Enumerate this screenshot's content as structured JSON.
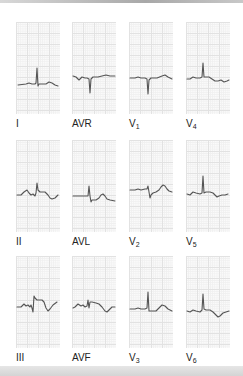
{
  "figure": {
    "trace_color": "#555555",
    "grid_color": "#e2e2e2",
    "leads": [
      {
        "id": "I",
        "label": "I",
        "sub": "",
        "row": 0,
        "col": 0
      },
      {
        "id": "AVR",
        "label": "AVR",
        "sub": "",
        "row": 0,
        "col": 1
      },
      {
        "id": "V1",
        "label": "V",
        "sub": "1",
        "row": 0,
        "col": 2
      },
      {
        "id": "V4",
        "label": "V",
        "sub": "4",
        "row": 0,
        "col": 3
      },
      {
        "id": "II",
        "label": "II",
        "sub": "",
        "row": 1,
        "col": 0
      },
      {
        "id": "AVL",
        "label": "AVL",
        "sub": "",
        "row": 1,
        "col": 1
      },
      {
        "id": "V2",
        "label": "V",
        "sub": "2",
        "row": 1,
        "col": 2
      },
      {
        "id": "V5",
        "label": "V",
        "sub": "5",
        "row": 1,
        "col": 3
      },
      {
        "id": "III",
        "label": "III",
        "sub": "",
        "row": 2,
        "col": 0
      },
      {
        "id": "AVF",
        "label": "AVF",
        "sub": "",
        "row": 2,
        "col": 1
      },
      {
        "id": "V3",
        "label": "V",
        "sub": "3",
        "row": 2,
        "col": 2
      },
      {
        "id": "V6",
        "label": "V",
        "sub": "6",
        "row": 2,
        "col": 3
      }
    ]
  }
}
